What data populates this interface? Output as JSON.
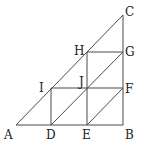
{
  "diagram": {
    "type": "geometry",
    "points": {
      "A": {
        "label": "A",
        "x": 16,
        "y": 125
      },
      "D": {
        "label": "D",
        "x": 51,
        "y": 125
      },
      "E": {
        "label": "E",
        "x": 87,
        "y": 125
      },
      "B": {
        "label": "B",
        "x": 123,
        "y": 125
      },
      "F": {
        "label": "F",
        "x": 123,
        "y": 88
      },
      "G": {
        "label": "G",
        "x": 123,
        "y": 52
      },
      "C": {
        "label": "C",
        "x": 123,
        "y": 15
      },
      "I": {
        "label": "I",
        "x": 51,
        "y": 88
      },
      "J": {
        "label": "J",
        "x": 87,
        "y": 88
      },
      "H": {
        "label": "H",
        "x": 87,
        "y": 52
      }
    },
    "segments": [
      [
        "A",
        "B"
      ],
      [
        "B",
        "C"
      ],
      [
        "A",
        "C"
      ],
      [
        "I",
        "F"
      ],
      [
        "H",
        "G"
      ],
      [
        "I",
        "D"
      ],
      [
        "H",
        "E"
      ],
      [
        "D",
        "G"
      ],
      [
        "E",
        "F"
      ]
    ],
    "line_color": "#4a4a4a"
  }
}
